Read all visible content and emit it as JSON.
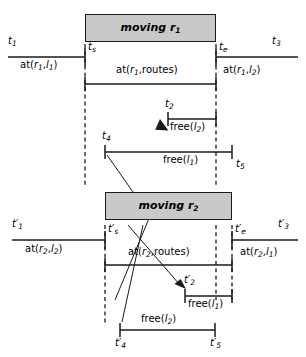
{
  "diagram": {
    "colors": {
      "box_fill": "#c9c9c9",
      "box_stroke": "#1a1a1a",
      "line": "#1a1a1a",
      "background": "#ffffff"
    },
    "boxes": [
      {
        "id": "moving-r1",
        "label": "moving r",
        "sub": "1"
      },
      {
        "id": "moving-r2",
        "label": "moving r",
        "sub": "2"
      }
    ],
    "ticks": {
      "t1": {
        "base": "t",
        "sub": "1",
        "prime": ""
      },
      "ts": {
        "base": "t",
        "sub": "s",
        "prime": ""
      },
      "te": {
        "base": "t",
        "sub": "e",
        "prime": ""
      },
      "t3": {
        "base": "t",
        "sub": "3",
        "prime": ""
      },
      "t2": {
        "base": "t",
        "sub": "2",
        "prime": ""
      },
      "t4": {
        "base": "t",
        "sub": "4",
        "prime": ""
      },
      "t5": {
        "base": "t",
        "sub": "5",
        "prime": ""
      },
      "t1p": {
        "base": "t",
        "sub": "1",
        "prime": "′"
      },
      "tsp": {
        "base": "t",
        "sub": "s",
        "prime": "′"
      },
      "tep": {
        "base": "t",
        "sub": "e",
        "prime": "′"
      },
      "t3p": {
        "base": "t",
        "sub": "3",
        "prime": "′"
      },
      "t2p": {
        "base": "t",
        "sub": "2",
        "prime": "′"
      },
      "t4p": {
        "base": "t",
        "sub": "4",
        "prime": "′"
      },
      "t5p": {
        "base": "t",
        "sub": "5",
        "prime": "′"
      }
    },
    "predicates": {
      "at_r1_l1": {
        "fn": "at(",
        "a": "r",
        "asub": "1",
        "sep": ",",
        "b": "l",
        "bsub": "1",
        "close": ")"
      },
      "at_r1_routes": {
        "fn": "at(",
        "a": "r",
        "asub": "1",
        "sep": ",",
        "b": "routes",
        "bsub": "",
        "close": ")"
      },
      "at_r1_l2": {
        "fn": "at(",
        "a": "r",
        "asub": "1",
        "sep": ",",
        "b": "l",
        "bsub": "2",
        "close": ")"
      },
      "at_r2_l2": {
        "fn": "at(",
        "a": "r",
        "asub": "2",
        "sep": ",",
        "b": "l",
        "bsub": "2",
        "close": ")"
      },
      "at_r2_routes": {
        "fn": "at(",
        "a": "r",
        "asub": "2",
        "sep": ",",
        "b": "routes",
        "bsub": "",
        "close": ")"
      },
      "at_r2_l1": {
        "fn": "at(",
        "a": "r",
        "asub": "2",
        "sep": ",",
        "b": "l",
        "bsub": "1",
        "close": ")"
      },
      "free_l2_top": {
        "fn": "free(",
        "b": "l",
        "bsub": "2",
        "close": ")"
      },
      "free_l1_top": {
        "fn": "free(",
        "b": "l",
        "bsub": "1",
        "close": ")"
      },
      "free_l1_bot": {
        "fn": "free(",
        "b": "l",
        "bsub": "1",
        "close": ")"
      },
      "free_l2_bot": {
        "fn": "free(",
        "b": "l",
        "bsub": "2",
        "close": ")"
      }
    },
    "intervals": [
      {
        "id": "at-r1-l1",
        "label_key": "at_r1_l1",
        "x1": 8,
        "x2": 85,
        "y": 57,
        "cap_left": false,
        "cap_right": true
      },
      {
        "id": "at-r1-l2",
        "label_key": "at_r1_l2",
        "x1": 216,
        "x2": 298,
        "y": 57,
        "cap_left": true,
        "cap_right": false
      },
      {
        "id": "at-r1-routes",
        "label_key": "at_r1_routes",
        "x1": 85,
        "x2": 216,
        "y": 84,
        "cap_left": true,
        "cap_right": true
      },
      {
        "id": "free-l2-top",
        "label_key": "free_l2_top",
        "x1": 168,
        "x2": 216,
        "y": 119,
        "cap_left": true,
        "cap_right": true
      },
      {
        "id": "free-l1-top",
        "label_key": "free_l1_top",
        "x1": 105,
        "x2": 232,
        "y": 152,
        "cap_left": true,
        "cap_right": true
      },
      {
        "id": "at-r2-l2",
        "label_key": "at_r2_l2",
        "x1": 12,
        "x2": 105,
        "y": 240,
        "cap_left": false,
        "cap_right": true
      },
      {
        "id": "at-r2-l1",
        "label_key": "at_r2_l1",
        "x1": 232,
        "x2": 298,
        "y": 240,
        "cap_left": true,
        "cap_right": false
      },
      {
        "id": "at-r2-routes",
        "label_key": "at_r2_routes",
        "x1": 105,
        "x2": 232,
        "y": 265,
        "cap_left": true,
        "cap_right": true
      },
      {
        "id": "free-l1-bot",
        "label_key": "free_l1_bot",
        "x1": 185,
        "x2": 232,
        "y": 296,
        "cap_left": true,
        "cap_right": true
      },
      {
        "id": "free-l2-bot",
        "label_key": "free_l2_bot",
        "x1": 120,
        "x2": 215,
        "y": 330,
        "cap_left": true,
        "cap_right": true
      }
    ]
  }
}
